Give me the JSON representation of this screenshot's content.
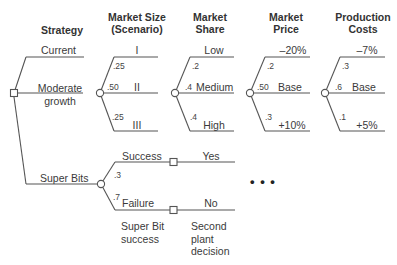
{
  "headers": {
    "strategy": "Strategy",
    "market_size": [
      "Market Size",
      "(Scenario)"
    ],
    "market_share": [
      "Market",
      "Share"
    ],
    "market_price": [
      "Market",
      "Price"
    ],
    "production_costs": [
      "Production",
      "Costs"
    ]
  },
  "strategy": {
    "options": [
      {
        "label": "Current"
      },
      {
        "label_lines": [
          "Moderate",
          "growth"
        ]
      },
      {
        "label": "Super Bits"
      }
    ]
  },
  "market_size": {
    "branches": [
      {
        "label": "I",
        "prob": ".25"
      },
      {
        "label": "II",
        "prob": ".50"
      },
      {
        "label": "III",
        "prob": ".25"
      }
    ]
  },
  "market_share": {
    "branches": [
      {
        "label": "Low",
        "prob": ".2"
      },
      {
        "label": "Medium",
        "prob": ".4"
      },
      {
        "label": "High",
        "prob": ".4"
      }
    ]
  },
  "market_price": {
    "branches": [
      {
        "label": "–20%",
        "prob": ".2"
      },
      {
        "label": "Base",
        "prob": ".50"
      },
      {
        "label": "+10%",
        "prob": ".3"
      }
    ]
  },
  "production_costs": {
    "branches": [
      {
        "label": "–7%",
        "prob": ".3"
      },
      {
        "label": "Base",
        "prob": ".6"
      },
      {
        "label": "+5%",
        "prob": ".1"
      }
    ]
  },
  "super_bits": {
    "branches": [
      {
        "label": "Success",
        "prob": ".3",
        "next": "Yes"
      },
      {
        "label": "Failure",
        "prob": ".7",
        "next": "No"
      }
    ],
    "chance_caption": [
      "Super Bit",
      "success"
    ],
    "decision_caption": [
      "Second",
      "plant",
      "decision"
    ]
  },
  "ellipsis": "•  •  •",
  "colors": {
    "line": "#555555",
    "text": "#3a3a3a",
    "background": "#ffffff"
  }
}
